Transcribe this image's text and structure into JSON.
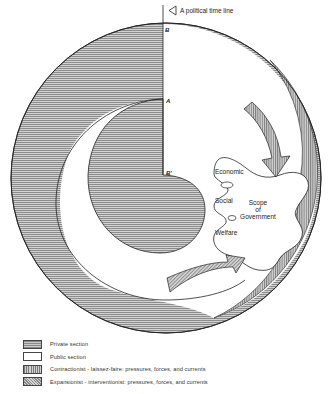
{
  "diagram": {
    "title": "A political time line",
    "points": {
      "B": "B",
      "A": "A",
      "B_prime": "B'"
    },
    "scope_labels": {
      "economic": "Economic",
      "social": "Social",
      "welfare": "Welfare",
      "scope_line1": "Scope",
      "scope_line2": "of",
      "scope_line3": "Government"
    },
    "colors": {
      "line": "#222222",
      "private_fill": "#b5b5b5",
      "public_fill": "#ffffff",
      "arrow_fill": "#c4c4c4"
    }
  },
  "legend": {
    "items": [
      {
        "key": "private",
        "label": "Private section"
      },
      {
        "key": "public",
        "label": "Public section"
      },
      {
        "key": "contractionist",
        "label": "Contractionist - laissez-faire: pressures, forces, and currents"
      },
      {
        "key": "expansionist",
        "label": "Expansionist - interventionist: pressures, forces, and currents"
      }
    ]
  }
}
